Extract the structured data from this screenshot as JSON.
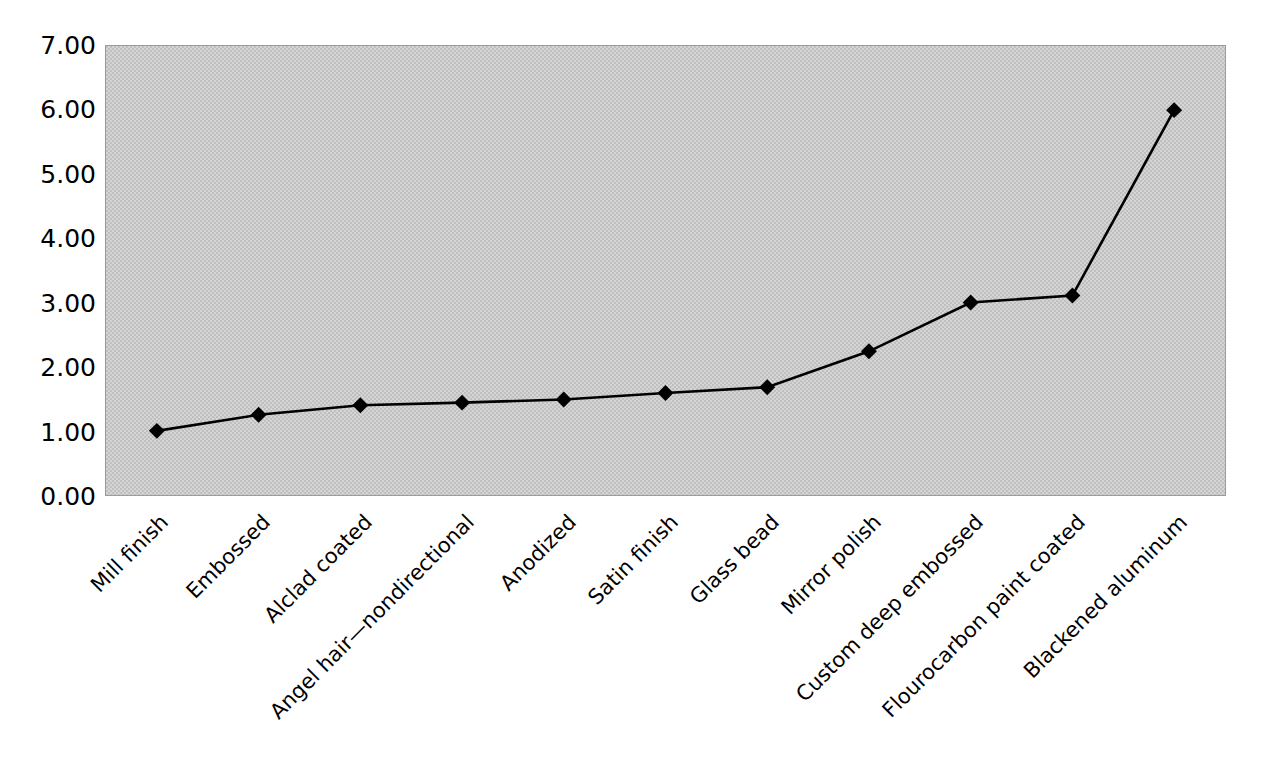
{
  "chart_data": {
    "type": "line",
    "title": "",
    "subtitle": "",
    "xlabel": "",
    "ylabel": "",
    "ylim": [
      0,
      7
    ],
    "ytick_step": 1,
    "grid": false,
    "legend": "none",
    "marker": "diamond",
    "categories": [
      "Mill finish",
      "Embossed",
      "Alclad coated",
      "Angel hair—nondirectional",
      "Anodized",
      "Satin finish",
      "Glass bead",
      "Mirror polish",
      "Custom deep embossed",
      "Flourocarbon paint coated",
      "Blackened aluminum"
    ],
    "values": [
      1.0,
      1.25,
      1.4,
      1.44,
      1.49,
      1.59,
      1.68,
      2.24,
      3.0,
      3.11,
      6.0
    ],
    "ytick_labels": [
      "0.00",
      "1.00",
      "2.00",
      "3.00",
      "4.00",
      "5.00",
      "6.00",
      "7.00"
    ],
    "ytick_values": [
      0,
      1,
      2,
      3,
      4,
      5,
      6,
      7
    ],
    "colors": {
      "plot_background": "#bfbfbf",
      "plot_border": "#9a9a9a",
      "series_line": "#000000",
      "series_marker": "#000000",
      "page_background": "#ffffff",
      "text": "#000000"
    }
  }
}
